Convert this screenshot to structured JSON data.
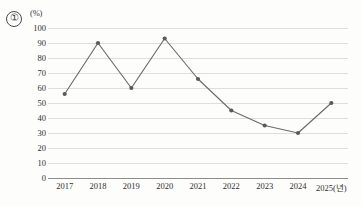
{
  "figure": {
    "item_marker": "①",
    "unit_label": "(%)"
  },
  "chart_data": {
    "type": "line",
    "title": "",
    "subtitle": "",
    "xlabel": "(년)",
    "ylabel": "(%)",
    "categories": [
      "2017",
      "2018",
      "2019",
      "2020",
      "2021",
      "2022",
      "2023",
      "2024",
      "2025"
    ],
    "x_tick_labels": [
      "2017",
      "2018",
      "2019",
      "2020",
      "2021",
      "2022",
      "2023",
      "2024",
      "2025(년)"
    ],
    "values": [
      56,
      90,
      60,
      93,
      66,
      45,
      35,
      30,
      50
    ],
    "series": [
      {
        "name": "",
        "values": [
          56,
          90,
          60,
          93,
          66,
          45,
          35,
          30,
          50
        ]
      }
    ],
    "ylim": [
      0,
      100
    ],
    "y_tick_labels": [
      "100",
      "90",
      "80",
      "70",
      "60",
      "50",
      "40",
      "30",
      "20",
      "10",
      "0"
    ],
    "y_ticks": [
      100,
      90,
      80,
      70,
      60,
      50,
      40,
      30,
      20,
      10,
      0
    ],
    "grid": true,
    "legend": false,
    "legend_position": "none",
    "marker": "circle",
    "line_color": "#6b6b6b",
    "marker_color": "#5a5a5a",
    "grid_color": "#dedede",
    "axis_color": "#8c8c8c"
  }
}
